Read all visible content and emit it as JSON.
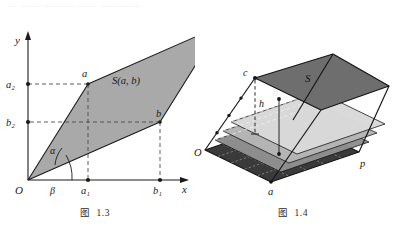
{
  "page": {
    "ghost_text": "— —— ——— —— ————",
    "background": "#ffffff"
  },
  "figure_13": {
    "caption_label": "图",
    "caption_number": "1.3",
    "axes": {
      "y_label": "y",
      "x_label": "x",
      "origin_label": "O"
    },
    "angles": {
      "alpha": "α",
      "beta": "β"
    },
    "points": {
      "a": "a",
      "b": "b",
      "a1": "a₁",
      "b1": "b₁",
      "a2": "a₂",
      "b2": "b₂"
    },
    "area_label": "S(a, b)",
    "colors": {
      "fill": "#a9a9a9",
      "stroke": "#1a1a1a",
      "dash": "#4a4a4a",
      "axis": "#1a1a1a"
    },
    "geometry": {
      "origin": [
        28,
        176
      ],
      "a": [
        88,
        80
      ],
      "b": [
        160,
        118
      ],
      "sum": [
        220,
        22
      ],
      "a1": [
        88,
        176
      ],
      "b1": [
        160,
        176
      ],
      "a2": [
        28,
        80
      ],
      "b2": [
        28,
        118
      ]
    }
  },
  "figure_14": {
    "caption_label": "图",
    "caption_number": "1.4",
    "points": {
      "O": "O",
      "a": "a",
      "p": "p",
      "b": "b",
      "c": "c",
      "S": "S",
      "h": "h"
    },
    "colors": {
      "top_face": "#6e6e6e",
      "base_face": "#3a3a3a",
      "slab_light": "#d9d9d9",
      "slab_mid": "#b5b5b5",
      "slab_dark": "#8f8f8f",
      "stroke": "#151515",
      "dash": "#f2f2f2"
    },
    "layers": 4
  }
}
